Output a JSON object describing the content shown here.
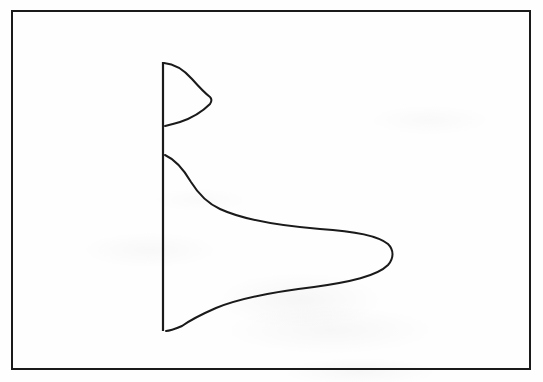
{
  "figure": {
    "kind": "scanned-line-figure",
    "background_color": "#fefefe",
    "ink_color": "#1a1a1a",
    "frame": {
      "name": "figure-border",
      "x": 12,
      "y": 11,
      "width": 518,
      "height": 358,
      "stroke_width": 2.2
    },
    "axis": {
      "name": "vertical-axis",
      "x": 163,
      "y_top": 62,
      "y_bottom": 331,
      "stroke_width": 2.2,
      "orientation": "vertical"
    }
  },
  "chart_data": {
    "type": "line",
    "title": "",
    "subtitle": "",
    "xlabel": "",
    "ylabel": "",
    "xlim": [
      163,
      530
    ],
    "ylim": [
      62,
      331
    ],
    "grid": false,
    "legend": false,
    "orientation": "horizontal-density-on-vertical-axis",
    "series": [
      {
        "name": "upper-distribution",
        "shape": "bell-curve",
        "baseline_x": 163,
        "peak_x": 212,
        "peak_y": 97,
        "amplitude_px": 49,
        "y_start": 63,
        "y_end": 126,
        "path": "M 164 63 C 176 64, 184 70, 192 79 C 200 88, 206 94, 210 97 C 212 99, 212 101, 210 104 C 203 111, 192 118, 180 122 C 174 124, 169 125, 165 126"
      },
      {
        "name": "lower-distribution",
        "shape": "bell-curve",
        "baseline_x": 163,
        "peak_x": 394,
        "peak_y": 235,
        "amplitude_px": 231,
        "y_start": 155,
        "y_end": 331,
        "path": "M 165 155 C 176 160, 184 170, 191 182 C 199 195, 207 203, 220 209 C 244 220, 282 226, 320 229 C 352 231, 377 235, 388 244 C 394 250, 394 258, 388 265 C 377 276, 350 282, 314 287 C 272 292, 238 299, 216 308 C 200 315, 189 321, 182 326 C 175 329, 170 331, 166 331"
      }
    ]
  }
}
